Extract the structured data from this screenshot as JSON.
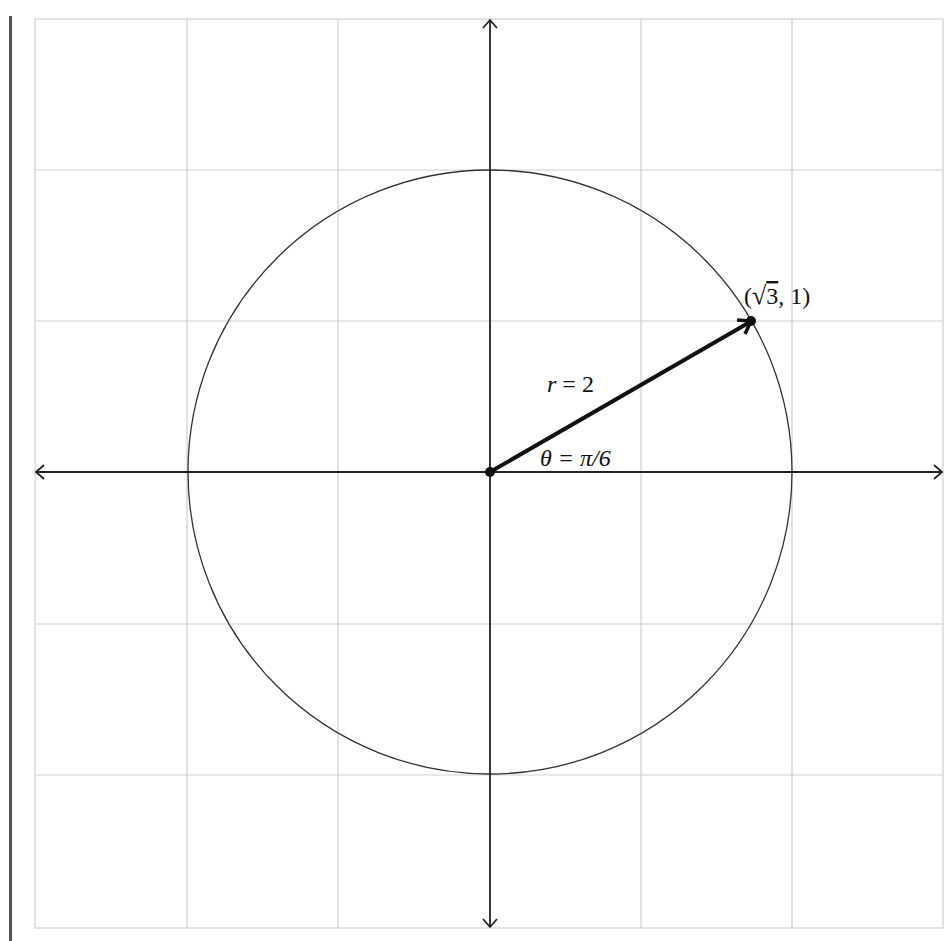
{
  "diagram": {
    "type": "polar-coordinate-illustration",
    "grid": {
      "x_range": [
        -3,
        3
      ],
      "y_range": [
        -3,
        3
      ],
      "step": 1,
      "color": "#c8c8c8"
    },
    "axes": {
      "color": "#222222",
      "arrows": "both-ends"
    },
    "circle": {
      "center": [
        0,
        0
      ],
      "radius": 2,
      "color": "#333333"
    },
    "vector": {
      "from": [
        0,
        0
      ],
      "to": [
        1.732,
        1
      ],
      "color": "#111111"
    },
    "labels": {
      "point": "(√3, 1)",
      "point_prefix": "(",
      "point_sqrt_arg": "3",
      "point_suffix": ", 1)",
      "radius": "r = 2",
      "radius_var": "r",
      "radius_eq": " = 2",
      "angle": "θ = π/6",
      "angle_text": "θ = π/6"
    }
  }
}
